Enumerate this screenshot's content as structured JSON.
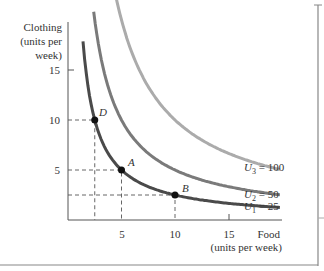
{
  "chart_data": {
    "type": "line",
    "title": "",
    "xlabel": "Food (units per week)",
    "xlabel_lines": [
      "Food",
      "(units per week)"
    ],
    "ylabel": "Clothing (units per week)",
    "ylabel_lines": [
      "Clothing",
      "(units per",
      "week)"
    ],
    "xlim": [
      0,
      20
    ],
    "ylim": [
      0,
      18
    ],
    "grid": false,
    "x_ticks": [
      5,
      10,
      15
    ],
    "y_ticks": [
      5,
      10,
      15
    ],
    "x_tick_labels": [
      "5",
      "10",
      "15"
    ],
    "y_tick_labels": [
      "5",
      "10",
      "15"
    ],
    "series": [
      {
        "name": "U1 = 25",
        "label_main": "U",
        "label_sub": "1",
        "label_val": " = 25",
        "utility": 25,
        "color": "#4a4a4a",
        "equation": "x*y=25",
        "x_range": [
          1.4,
          19.8
        ]
      },
      {
        "name": "U2 = 50",
        "label_main": "U",
        "label_sub": "2",
        "label_val": " = 50",
        "utility": 50,
        "color": "#7a7a7a",
        "equation": "x*y=50",
        "x_range": [
          2.4,
          19.8
        ]
      },
      {
        "name": "U3 = 100",
        "label_main": "U",
        "label_sub": "3",
        "label_val": " = 100",
        "utility": 100,
        "color": "#ababab",
        "equation": "x*y=100",
        "x_range": [
          4.2,
          19.8
        ]
      }
    ],
    "points": [
      {
        "label": "D",
        "x": 2.5,
        "y": 10
      },
      {
        "label": "A",
        "x": 5,
        "y": 5
      },
      {
        "label": "B",
        "x": 10,
        "y": 2.5
      }
    ],
    "legend_position": "inline-right"
  }
}
